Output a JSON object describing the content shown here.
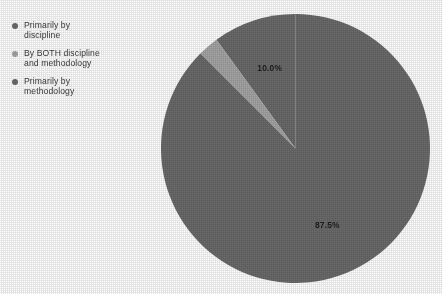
{
  "legend": {
    "items": [
      {
        "label": "Primarily by\ndiscipline",
        "color": "#6b6b6b",
        "marker": "legend-dot-icon"
      },
      {
        "label": "By BOTH discipline\nand methodology",
        "color": "#a5a5a5",
        "marker": "legend-dot-icon"
      },
      {
        "label": "Primarily by\nmethodology",
        "color": "#6b6b6b",
        "marker": "legend-dot-icon"
      }
    ]
  },
  "chart_data": {
    "type": "pie",
    "title": "",
    "categories": [
      "Primarily by discipline",
      "By BOTH discipline and methodology",
      "Primarily by methodology"
    ],
    "values": [
      10.0,
      2.5,
      87.5
    ],
    "value_labels": [
      "10.0%",
      "",
      "87.5%"
    ],
    "colors": [
      "#6b6b6b",
      "#a5a5a5",
      "#6b6b6b"
    ],
    "units": "percent",
    "start_angle_deg": 90,
    "direction": "counterclockwise",
    "legend_position": "top-left",
    "grid": false,
    "shown_labels": [
      {
        "text": "10.0%",
        "slice": "Primarily by discipline"
      },
      {
        "text": "87.5%",
        "slice": "Primarily by methodology"
      }
    ]
  }
}
